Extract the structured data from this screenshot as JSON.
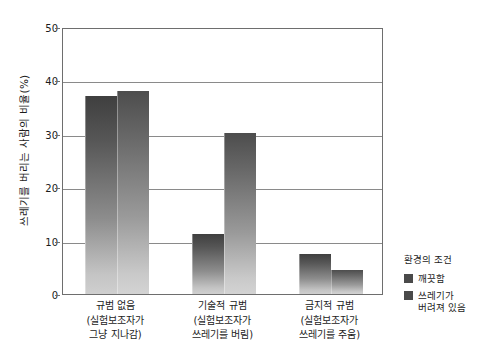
{
  "chart_data": {
    "type": "bar",
    "title": "",
    "xlabel": "",
    "ylabel": "쓰레기를 버리는 사람의 비율(%)",
    "ylim": [
      0,
      50
    ],
    "yticks": [
      0,
      10,
      20,
      30,
      40,
      50
    ],
    "ytick_labels": [
      "0",
      "10",
      "20",
      "30",
      "40",
      "50"
    ],
    "grid": "horizontal",
    "legend_position": "right",
    "categories": [
      "규범 없음\n(실험보조자가 그냥 지나감)",
      "기술적 규범\n(실험보조자가 쓰레기를 버림)",
      "금지적 규범\n(실험보조자가 쓰레기를 주움)"
    ],
    "category_lines": [
      {
        "head": "규범 없음",
        "sub": "(실험보조자가\n그냥 지나감)"
      },
      {
        "head": "기술적 규범",
        "sub": "(실험보조자가\n쓰레기를 버림)"
      },
      {
        "head": "금지적 규범",
        "sub": "(실험보조자가\n쓰레기를 주움)"
      }
    ],
    "series": [
      {
        "name": "깨끗함",
        "values": [
          37.0,
          11.2,
          7.4
        ],
        "color": "#4a4a4a"
      },
      {
        "name": "쓰레기가 버려져 있음",
        "values": [
          38.0,
          30.2,
          4.5
        ],
        "color": "#5a5a5a"
      }
    ]
  },
  "axis": {
    "y_title": "쓰레기를 버리는 사람의 비율(%)",
    "ticks": [
      {
        "label": "50",
        "value": 50
      },
      {
        "label": "40",
        "value": 40
      },
      {
        "label": "30",
        "value": 30
      },
      {
        "label": "20",
        "value": 20
      },
      {
        "label": "10",
        "value": 10
      },
      {
        "label": "0",
        "value": 0
      }
    ]
  },
  "xaxis": {
    "groups": [
      {
        "head": "규범 없음",
        "line2": "(실험보조자가",
        "line3": "그냥 지나감)"
      },
      {
        "head": "기술적 규범",
        "line2": "(실험보조자가",
        "line3": "쓰레기를 버림)"
      },
      {
        "head": "금지적 규범",
        "line2": "(실험보조자가",
        "line3": "쓰레기를 주움)"
      }
    ]
  },
  "legend": {
    "title": "환경의 조건",
    "items": [
      {
        "label": "깨끗함",
        "label2": "",
        "color": "#4a4a4a"
      },
      {
        "label": "쓰레기가",
        "label2": "버려져 있음",
        "color": "#4a4a4a"
      }
    ]
  }
}
